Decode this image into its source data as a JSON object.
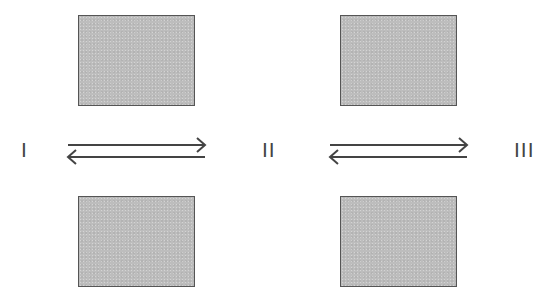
{
  "diagram": {
    "type": "equilibrium",
    "species": [
      {
        "label": "I"
      },
      {
        "label": "II"
      },
      {
        "label": "III"
      }
    ],
    "equilibria": [
      {
        "from": "I",
        "to": "II",
        "arrow": "reversible"
      },
      {
        "from": "II",
        "to": "III",
        "arrow": "reversible"
      }
    ],
    "boxes": [
      {
        "position": "top-left",
        "fill": "#bdbdbd",
        "border": "#555555"
      },
      {
        "position": "top-right",
        "fill": "#bdbdbd",
        "border": "#555555"
      },
      {
        "position": "bottom-left",
        "fill": "#bdbdbd",
        "border": "#555555"
      },
      {
        "position": "bottom-right",
        "fill": "#bdbdbd",
        "border": "#555555"
      }
    ],
    "colors": {
      "line": "#444444",
      "background": "#ffffff"
    }
  }
}
